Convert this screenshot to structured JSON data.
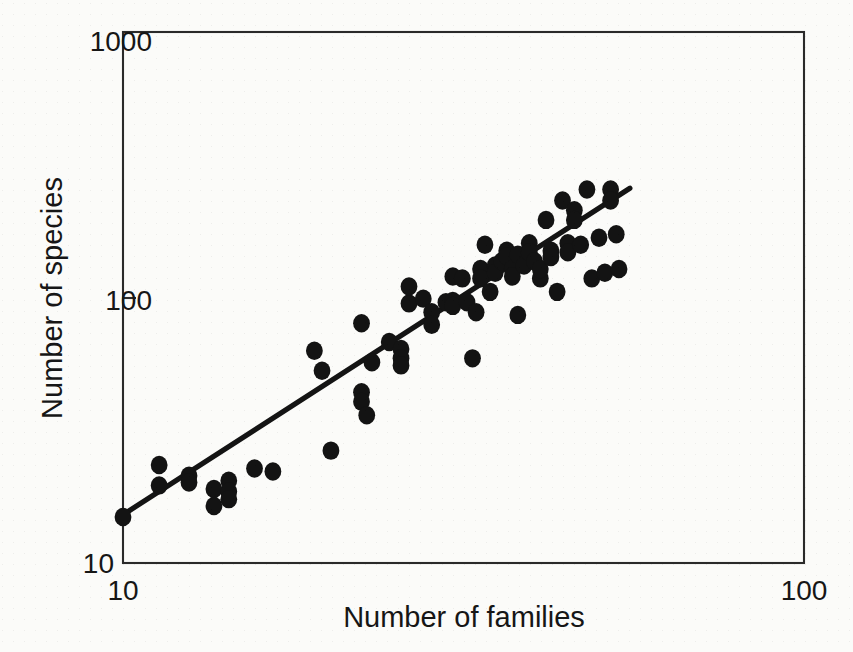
{
  "chart_data": {
    "type": "scatter",
    "title": "",
    "xlabel": "Number of families",
    "ylabel": "Number of species",
    "xscale": "log",
    "yscale": "log",
    "xlim": [
      10,
      100
    ],
    "ylim": [
      10,
      1000
    ],
    "grid": false,
    "legend": null,
    "xticks": [
      10,
      100
    ],
    "xtick_labels": [
      "10",
      "100"
    ],
    "yticks": [
      10,
      100,
      1000
    ],
    "ytick_labels": [
      "10",
      "100",
      "1000"
    ],
    "marker": "filled-circle",
    "marker_color": "#131313",
    "points": [
      {
        "x": 10.0,
        "y": 14.9
      },
      {
        "x": 11.3,
        "y": 23.4
      },
      {
        "x": 11.3,
        "y": 19.6
      },
      {
        "x": 12.5,
        "y": 21.3
      },
      {
        "x": 12.5,
        "y": 20.1
      },
      {
        "x": 13.6,
        "y": 19.0
      },
      {
        "x": 13.6,
        "y": 16.4
      },
      {
        "x": 14.3,
        "y": 20.4
      },
      {
        "x": 14.3,
        "y": 18.6
      },
      {
        "x": 14.3,
        "y": 17.4
      },
      {
        "x": 15.6,
        "y": 22.7
      },
      {
        "x": 16.6,
        "y": 22.1
      },
      {
        "x": 19.1,
        "y": 63.0
      },
      {
        "x": 19.6,
        "y": 53.0
      },
      {
        "x": 20.2,
        "y": 26.5
      },
      {
        "x": 22.4,
        "y": 44.0
      },
      {
        "x": 22.4,
        "y": 40.5
      },
      {
        "x": 22.8,
        "y": 36.0
      },
      {
        "x": 22.4,
        "y": 80.0
      },
      {
        "x": 23.2,
        "y": 57.0
      },
      {
        "x": 24.6,
        "y": 68.0
      },
      {
        "x": 25.6,
        "y": 64.0
      },
      {
        "x": 25.6,
        "y": 59.0
      },
      {
        "x": 25.6,
        "y": 55.5
      },
      {
        "x": 26.3,
        "y": 95.0
      },
      {
        "x": 26.3,
        "y": 110.0
      },
      {
        "x": 27.6,
        "y": 99.0
      },
      {
        "x": 28.4,
        "y": 88.0
      },
      {
        "x": 28.4,
        "y": 79.0
      },
      {
        "x": 29.8,
        "y": 96.0
      },
      {
        "x": 30.5,
        "y": 97.0
      },
      {
        "x": 30.5,
        "y": 93.0
      },
      {
        "x": 30.5,
        "y": 120.0
      },
      {
        "x": 31.5,
        "y": 118.0
      },
      {
        "x": 32.0,
        "y": 96.0
      },
      {
        "x": 32.6,
        "y": 59.0
      },
      {
        "x": 33.0,
        "y": 88.0
      },
      {
        "x": 33.5,
        "y": 128.0
      },
      {
        "x": 33.5,
        "y": 118.0
      },
      {
        "x": 34.0,
        "y": 158.0
      },
      {
        "x": 34.6,
        "y": 105.0
      },
      {
        "x": 35.2,
        "y": 132.0
      },
      {
        "x": 35.2,
        "y": 124.0
      },
      {
        "x": 36.0,
        "y": 137.0
      },
      {
        "x": 36.6,
        "y": 150.0
      },
      {
        "x": 36.6,
        "y": 143.0
      },
      {
        "x": 37.3,
        "y": 128.0
      },
      {
        "x": 37.3,
        "y": 120.0
      },
      {
        "x": 38.0,
        "y": 145.0
      },
      {
        "x": 38.0,
        "y": 86.0
      },
      {
        "x": 38.8,
        "y": 132.0
      },
      {
        "x": 39.5,
        "y": 160.0
      },
      {
        "x": 39.5,
        "y": 148.0
      },
      {
        "x": 40.2,
        "y": 137.0
      },
      {
        "x": 41.0,
        "y": 118.0
      },
      {
        "x": 41.0,
        "y": 128.0
      },
      {
        "x": 41.8,
        "y": 196.0
      },
      {
        "x": 42.5,
        "y": 150.0
      },
      {
        "x": 42.5,
        "y": 142.0
      },
      {
        "x": 43.4,
        "y": 105.0
      },
      {
        "x": 44.2,
        "y": 232.0
      },
      {
        "x": 45.0,
        "y": 160.0
      },
      {
        "x": 45.0,
        "y": 148.0
      },
      {
        "x": 46.0,
        "y": 213.0
      },
      {
        "x": 46.0,
        "y": 196.0
      },
      {
        "x": 47.0,
        "y": 158.0
      },
      {
        "x": 48.0,
        "y": 255.0
      },
      {
        "x": 48.8,
        "y": 118.0
      },
      {
        "x": 50.0,
        "y": 168.0
      },
      {
        "x": 51.0,
        "y": 124.0
      },
      {
        "x": 52.0,
        "y": 255.0
      },
      {
        "x": 52.0,
        "y": 232.0
      },
      {
        "x": 53.0,
        "y": 173.0
      },
      {
        "x": 53.5,
        "y": 128.0
      }
    ],
    "fit_line": {
      "label": "",
      "x": [
        10.0,
        55.5
      ],
      "y": [
        15.2,
        258.0
      ]
    },
    "annotations": []
  },
  "axes": {
    "y_top_label": "1000",
    "y_mid_label": "100",
    "y_bottom_label": "10",
    "x_left_label": "10",
    "x_right_label": "100",
    "x_title": "Number of families",
    "y_title": "Number of species"
  },
  "colors": {
    "ink": "#141414",
    "frame": "#2a2a2a",
    "paper": "#fbfbf9"
  }
}
